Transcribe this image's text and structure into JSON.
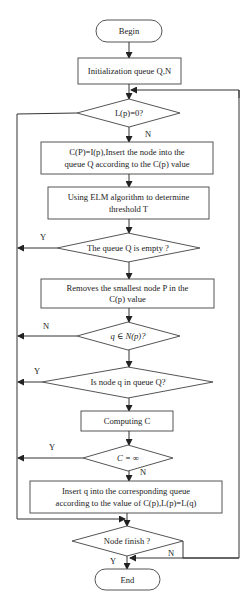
{
  "flowchart": {
    "begin": "Begin",
    "init": "Initialization queue Q,N",
    "check_lp": "L(p)=0?",
    "check_lp_no": "N",
    "cp_insert": [
      "C(P)=I(p),Insert the node into the",
      "queue Q according to the C(p) value"
    ],
    "elm": [
      "Using ELM  algorithm to determine",
      "threshold T"
    ],
    "queue_empty": "The queue Q is empty ?",
    "queue_empty_yes": "Y",
    "remove_node": [
      "Removes the smallest node P in the",
      "C(p) value"
    ],
    "q_in_np": "q ∈ N(p)?",
    "q_in_np_no": "N",
    "node_in_queue": "Is node q in queue Q?",
    "node_in_queue_yes": "Y",
    "computing": "Computing C",
    "c_inf": "C = ∞",
    "c_inf_yes": "Y",
    "c_inf_no": "N",
    "insert_q": [
      "Insert q into the corresponding queue",
      "according to the value of C(p),L(p)=L(q)"
    ],
    "node_finish": "Node finish ?",
    "node_finish_yes": "Y",
    "node_finish_no": "N",
    "end": "End"
  },
  "colors": {
    "stroke": "#555555",
    "text": "#222222",
    "background": "#ffffff"
  }
}
